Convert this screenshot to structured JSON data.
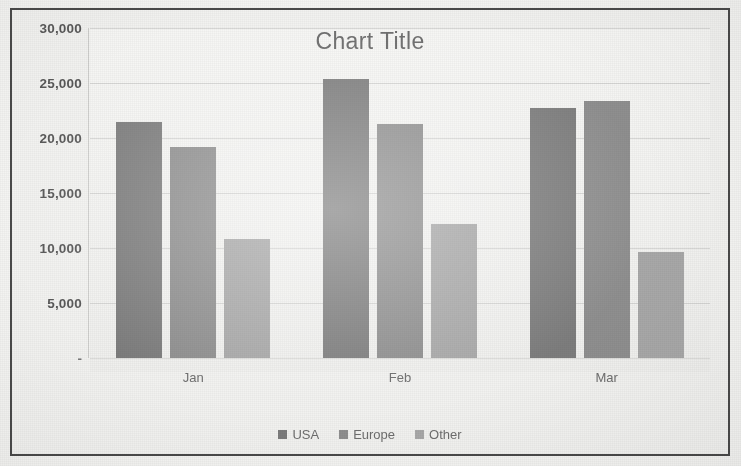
{
  "chart_data": {
    "type": "bar",
    "title": "Chart Title",
    "xlabel": "",
    "ylabel": "",
    "categories": [
      "Jan",
      "Feb",
      "Mar"
    ],
    "series": [
      {
        "name": "USA",
        "color": "#7d7d7d",
        "values": [
          21500,
          25400,
          22700
        ]
      },
      {
        "name": "Europe",
        "color": "#8f8f8f",
        "values": [
          19200,
          21300,
          23400
        ]
      },
      {
        "name": "Other",
        "color": "#a8a8a8",
        "values": [
          10800,
          12200,
          9600
        ]
      }
    ],
    "ylim": [
      0,
      30000
    ],
    "ytick_values": [
      30000,
      25000,
      20000,
      15000,
      10000,
      5000,
      0
    ],
    "ytick_labels": [
      "30,000",
      "25,000",
      "20,000",
      "15,000",
      "10,000",
      "5,000",
      "-"
    ],
    "grid": true,
    "grid_axis": "y",
    "legend": true,
    "legend_position": "bottom"
  },
  "frame": {
    "border_color": "#4a4a4a",
    "plot_background": "#f2f2f0"
  },
  "marks": {
    "stray_top_right": "",
    "stray_bottom_right": ""
  }
}
